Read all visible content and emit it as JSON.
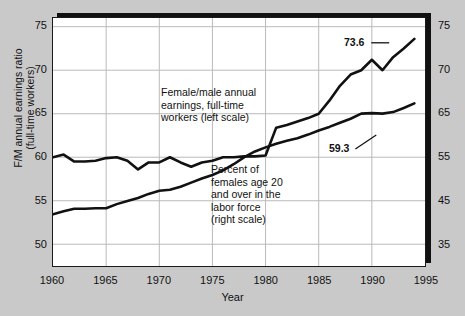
{
  "figure": {
    "cropped_header_fragment": "",
    "xlabel": "Year",
    "ylabel_left_line1": "F/M annual earnings ratio",
    "ylabel_left_line2": "(full-time workers)"
  },
  "annotations": {
    "series1_note": "Female/male annual\nearnings, full-time\nworkers (left scale)",
    "series2_note": "Percent of\nfemales age 20\nand over in the\nlabor force\n(right scale)",
    "series1_endlabel": "73.6",
    "series2_endlabel": "59.3"
  },
  "axis_left": {
    "ticks": [
      "75",
      "70",
      "65",
      "60",
      "55",
      "50"
    ]
  },
  "axis_right": {
    "ticks": [
      "75",
      "70",
      "65",
      "55",
      "45",
      "35"
    ]
  },
  "axis_x": {
    "ticks": [
      "1960",
      "1965",
      "1970",
      "1975",
      "1980",
      "1985",
      "1990",
      "1995"
    ]
  },
  "colors": {
    "line": "#111111",
    "grid": "#b9b9b9",
    "plot_bg": "#ffffff",
    "page_bg": "#c9c9c9",
    "frame": "#1a1a1a"
  },
  "chart_data": {
    "type": "line",
    "title": "",
    "xlabel": "Year",
    "ylabel": "F/M annual earnings ratio (full-time workers)",
    "ylabel_right": "Percent of females age 20 and over in the labor force",
    "xlim": [
      1960,
      1995
    ],
    "ylim_left": [
      47.5,
      76.0
    ],
    "ylim_right": [
      27.5,
      76.0
    ],
    "left_ticks": [
      75,
      70,
      65,
      60,
      55,
      50
    ],
    "right_ticks": [
      75,
      70,
      65,
      55,
      45,
      35
    ],
    "x_ticks": [
      1960,
      1965,
      1970,
      1975,
      1980,
      1985,
      1990,
      1995
    ],
    "grid": true,
    "legend": "annotations-inline",
    "series": [
      {
        "name": "Female/male annual earnings, full-time workers (left scale)",
        "axis": "left",
        "end_label": "73.6",
        "x": [
          1960,
          1961,
          1962,
          1963,
          1964,
          1965,
          1966,
          1967,
          1968,
          1969,
          1970,
          1971,
          1972,
          1973,
          1974,
          1975,
          1976,
          1977,
          1978,
          1979,
          1980,
          1981,
          1982,
          1983,
          1984,
          1985,
          1986,
          1987,
          1988,
          1989,
          1990,
          1991,
          1992,
          1993,
          1994
        ],
        "values": [
          60.0,
          60.3,
          59.5,
          59.5,
          59.6,
          59.9,
          60.0,
          59.6,
          58.6,
          59.4,
          59.4,
          60.0,
          59.4,
          58.9,
          59.4,
          59.6,
          60.0,
          60.0,
          60.1,
          60.1,
          60.2,
          63.4,
          63.7,
          64.1,
          64.5,
          65.0,
          66.5,
          68.2,
          69.5,
          70.0,
          71.2,
          70.0,
          71.5,
          72.5,
          73.6
        ]
      },
      {
        "name": "Percent of females age 20 and over in the labor force (right scale)",
        "axis": "right",
        "end_label": "59.3",
        "x": [
          1960,
          1961,
          1962,
          1963,
          1964,
          1965,
          1966,
          1967,
          1968,
          1969,
          1970,
          1971,
          1972,
          1973,
          1974,
          1975,
          1976,
          1977,
          1978,
          1979,
          1980,
          1981,
          1982,
          1983,
          1984,
          1985,
          1986,
          1987,
          1988,
          1989,
          1990,
          1991,
          1992,
          1993,
          1994
        ],
        "values": [
          37.6,
          38.2,
          38.7,
          38.7,
          38.8,
          38.8,
          39.6,
          40.2,
          40.8,
          41.6,
          42.2,
          42.4,
          43.0,
          43.8,
          44.6,
          45.3,
          46.2,
          47.4,
          48.8,
          49.9,
          50.7,
          51.4,
          52.0,
          52.5,
          53.2,
          54.0,
          54.7,
          55.5,
          56.3,
          57.3,
          57.4,
          57.3,
          57.6,
          58.4,
          59.3
        ]
      }
    ]
  }
}
